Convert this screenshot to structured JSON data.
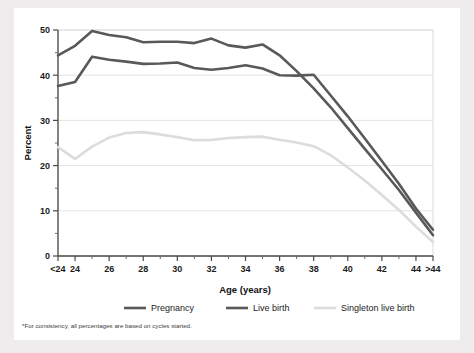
{
  "figure": {
    "footnote": "*For consistency, all percentages are based on cycles started.",
    "card_background": "#ffffff",
    "page_background": "#eeecec"
  },
  "chart_data": {
    "type": "line",
    "title": "",
    "xlabel": "Age (years)",
    "ylabel": "Percent",
    "xlim": [
      0,
      22
    ],
    "ylim": [
      0,
      50
    ],
    "yticks": [
      0,
      10,
      20,
      30,
      40,
      50
    ],
    "ytick_labels": [
      "0",
      "10",
      "20",
      "30",
      "40",
      "50"
    ],
    "yminor_ticks": [
      5,
      15,
      25,
      35,
      45
    ],
    "grid": "horizontal",
    "legend_position": "below-axis",
    "categories": [
      "<24",
      "24",
      "25",
      "26",
      "27",
      "28",
      "29",
      "30",
      "31",
      "32",
      "33",
      "34",
      "35",
      "36",
      "37",
      "38",
      "39",
      "40",
      "41",
      "42",
      "43",
      "44",
      ">44"
    ],
    "xtick_labels": [
      "<24",
      "24",
      "",
      "26",
      "",
      "28",
      "",
      "30",
      "",
      "32",
      "",
      "34",
      "",
      "36",
      "",
      "38",
      "",
      "40",
      "",
      "42",
      "",
      "44",
      ">44"
    ],
    "series": [
      {
        "name": "Pregnancy",
        "color": "#595959",
        "width": 2.6,
        "values": [
          44.4,
          46.5,
          49.8,
          48.9,
          48.4,
          47.3,
          47.4,
          47.4,
          47.1,
          48.1,
          46.6,
          46.1,
          46.8,
          44.4,
          40.9,
          37.1,
          32.9,
          28.3,
          23.7,
          19.2,
          14.6,
          9.6,
          4.6
        ]
      },
      {
        "name": "Live birth",
        "color": "#595959",
        "width": 2.6,
        "values": [
          37.6,
          38.5,
          44.1,
          43.4,
          43.0,
          42.5,
          42.6,
          42.8,
          41.6,
          41.2,
          41.6,
          42.2,
          41.5,
          40.0,
          39.9,
          40.1,
          35.5,
          30.9,
          26.0,
          21.0,
          16.0,
          10.5,
          5.8
        ]
      },
      {
        "name": "Singleton live birth",
        "color": "#dcdcdc",
        "width": 2.6,
        "values": [
          24.1,
          21.5,
          24.2,
          26.2,
          27.2,
          27.4,
          26.9,
          26.3,
          25.6,
          25.7,
          26.1,
          26.3,
          26.4,
          25.7,
          25.1,
          24.3,
          22.3,
          19.6,
          16.7,
          13.5,
          10.2,
          6.5,
          3.1
        ]
      }
    ],
    "legend": [
      {
        "label": "Pregnancy",
        "color": "#595959"
      },
      {
        "label": "Live birth",
        "color": "#595959"
      },
      {
        "label": "Singleton live birth",
        "color": "#dcdcdc"
      }
    ]
  }
}
